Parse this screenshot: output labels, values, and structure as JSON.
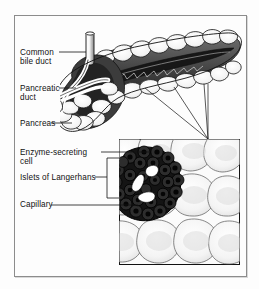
{
  "figure": {
    "type": "anatomical-illustration",
    "frame": {
      "border_color": "#8c8c8c",
      "background": "#fdfdfd"
    },
    "ink_color": "#111111"
  },
  "labels": {
    "common_bile_duct": "Common\nbile duct",
    "pancreatic_duct": "Pancreatic\nduct",
    "pancreas": "Pancreas",
    "enzyme_secreting_cell": "Enzyme-secreting\ncell",
    "islets_of_langerhans": "Islets of Langerhans",
    "capillary": "Capillary"
  },
  "organ_view": {
    "name": "pancreas-organ-drawing",
    "description": "Lobulated pancreas shown in profile, head at left with common bile duct and pancreatic duct, body and tail extending to the upper right; dark main duct channel runs lengthwise.",
    "parts": [
      "common-bile-duct-tube",
      "pancreatic-duct-tube",
      "lobules",
      "main-duct-channel",
      "head",
      "body",
      "tail"
    ]
  },
  "inset": {
    "name": "magnified-tissue-inset",
    "description": "Magnified view of pancreatic tissue: a dark round islet of Langerhans containing capillaries, surrounded by pale enzyme-secreting acinar cells.",
    "magnification_lines": 3,
    "contents": [
      "islet-of-langerhans",
      "capillary",
      "enzyme-secreting-cells"
    ]
  }
}
